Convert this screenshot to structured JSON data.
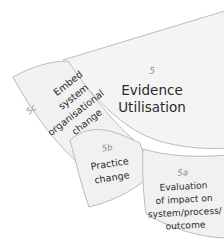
{
  "diagram": {
    "name": "Evidence Utilisation fan diagram",
    "colors": {
      "segment_fill": "#f3f3f3",
      "segment_fill_light": "#f6f6f6",
      "segment_stroke": "#b9b9b9",
      "code_text": "#8d8d8d",
      "body_text": "#2b2b2b",
      "background": "#ffffff"
    },
    "segments": [
      {
        "code": "5",
        "title_lines": [
          "Evidence",
          "Utilisation"
        ],
        "position": "inner-main"
      },
      {
        "code": "5c",
        "title_lines": [
          "Embed",
          "system",
          "organisational",
          "change"
        ],
        "position": "outer-left"
      },
      {
        "code": "5b",
        "title_lines": [
          "Practice",
          "change"
        ],
        "position": "outer-middle"
      },
      {
        "code": "5a",
        "title_lines": [
          "Evaluation",
          "of impact on",
          "system/process/",
          "outcome"
        ],
        "position": "outer-right"
      }
    ]
  }
}
